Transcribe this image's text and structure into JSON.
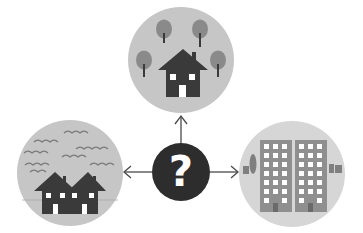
{
  "diagram": {
    "center": {
      "symbol": "?",
      "icon": "question-mark-icon"
    },
    "options": [
      {
        "position": "top",
        "label": "Detached house among trees",
        "icon": "house-with-trees-icon"
      },
      {
        "position": "left",
        "label": "Terraced houses with sea / waves",
        "icon": "seaside-houses-icon"
      },
      {
        "position": "right",
        "label": "High-rise apartment blocks",
        "icon": "apartment-buildings-icon"
      }
    ],
    "colors": {
      "circle_fill": "#c8c8c8",
      "circle_fill_light": "#d9d9d9",
      "house": "#3a3a3a",
      "tree": "#8a8a8a",
      "trunk": "#3a3a3a",
      "building": "#8f8f8f",
      "window": "#ffffff",
      "question_bg": "#2d2d2d",
      "arrow": "#4a4a4a",
      "wave": "#7a7a7a"
    }
  }
}
